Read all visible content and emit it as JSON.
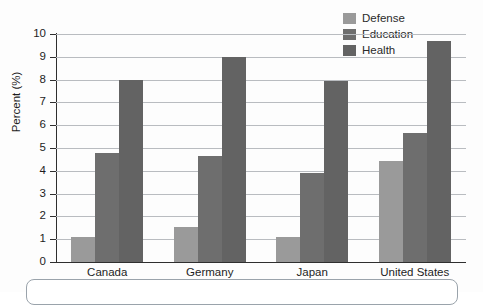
{
  "chart_data": {
    "type": "bar",
    "title": "",
    "xlabel": "",
    "ylabel": "Percent (%)",
    "ylim": [
      0,
      10
    ],
    "ytick_labels": [
      "10",
      "9",
      "8",
      "7",
      "6",
      "5",
      "4",
      "3",
      "2",
      "1",
      "0"
    ],
    "grid": true,
    "legend_position": "top-right",
    "categories": [
      "Canada",
      "Germany",
      "Japan",
      "United States"
    ],
    "series": [
      {
        "name": "Defense",
        "color": "#9a9a9a",
        "values": [
          1.1,
          1.55,
          1.1,
          4.45
        ]
      },
      {
        "name": "Education",
        "color": "#6e6e6e",
        "values": [
          4.8,
          4.65,
          3.9,
          5.65
        ]
      },
      {
        "name": "Health",
        "color": "#636363",
        "values": [
          8.0,
          9.0,
          7.95,
          9.7
        ]
      }
    ]
  },
  "legend": {
    "items": [
      {
        "label": "Defense",
        "color": "#9a9a9a"
      },
      {
        "label": "Education",
        "color": "#6e6e6e"
      },
      {
        "label": "Health",
        "color": "#636363"
      }
    ]
  },
  "axes": {
    "y_title": "Percent (%)",
    "y_ticks": [
      "10",
      "9",
      "8",
      "7",
      "6",
      "5",
      "4",
      "3",
      "2",
      "1",
      "0"
    ],
    "x_ticks": [
      "Canada",
      "Germany",
      "Japan",
      "United States"
    ]
  },
  "colors": {
    "grid": "#b9bcc0",
    "axis": "#2f2f2f",
    "text": "#1d1d1d",
    "background": "#fdfdfd",
    "caption_border": "#9aa3ab"
  }
}
